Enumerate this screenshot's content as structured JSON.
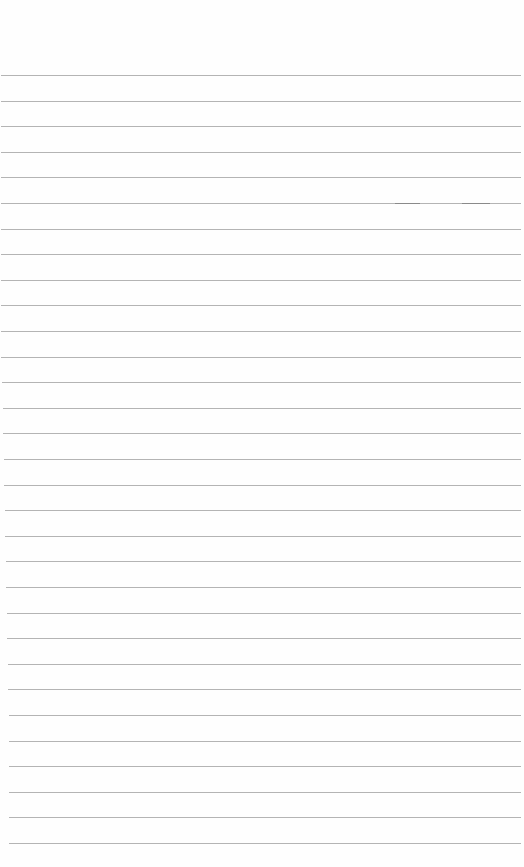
{
  "page": {
    "type": "lined-paper",
    "background_color": "#fefefe",
    "rule_color": "#b4b4b4",
    "rule_count": 31,
    "first_rule_y": 75,
    "rule_spacing": 25.6,
    "text_lines": []
  }
}
